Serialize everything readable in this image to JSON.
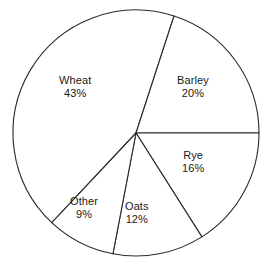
{
  "figure": {
    "background_color": "#ffffff",
    "outline_color": "#2b2b2b",
    "text_color": "#1a1a1a",
    "width": 265,
    "height": 264,
    "top_cropped_artifact": "n %"
  },
  "chart_data": {
    "type": "pie",
    "title": "",
    "subtitle": "",
    "xlabel": "",
    "ylabel": "",
    "grid": false,
    "legend": "none",
    "labels_inside_slices": true,
    "value_unit": "%",
    "categories": [
      "Wheat",
      "Barley",
      "Rye",
      "Oats",
      "Other"
    ],
    "values": [
      43,
      20,
      16,
      12,
      9
    ],
    "total": 100,
    "start_angle_deg": 0,
    "direction": "counterclockwise",
    "center": {
      "x": 136,
      "y": 133
    },
    "radius": 123,
    "slices": [
      {
        "name": "Wheat",
        "value": 43,
        "value_label": "43%",
        "fill": "#ffffff",
        "start_angle_deg": 72.0,
        "end_angle_deg": 226.8,
        "label_left": 59,
        "label_top": 74
      },
      {
        "name": "Barley",
        "value": 20,
        "value_label": "20%",
        "fill": "#ffffff",
        "start_angle_deg": 0.0,
        "end_angle_deg": 72.0,
        "label_left": 177,
        "label_top": 74
      },
      {
        "name": "Rye",
        "value": 16,
        "value_label": "16%",
        "fill": "#ffffff",
        "start_angle_deg": 302.4,
        "end_angle_deg": 360.0,
        "label_left": 182,
        "label_top": 149
      },
      {
        "name": "Oats",
        "value": 12,
        "value_label": "12%",
        "fill": "#ffffff",
        "start_angle_deg": 259.2,
        "end_angle_deg": 302.4,
        "label_left": 125,
        "label_top": 200
      },
      {
        "name": "Other",
        "value": 9,
        "value_label": "9%",
        "fill": "#ffffff",
        "start_angle_deg": 226.8,
        "end_angle_deg": 259.2,
        "label_left": 70,
        "label_top": 195
      }
    ]
  }
}
